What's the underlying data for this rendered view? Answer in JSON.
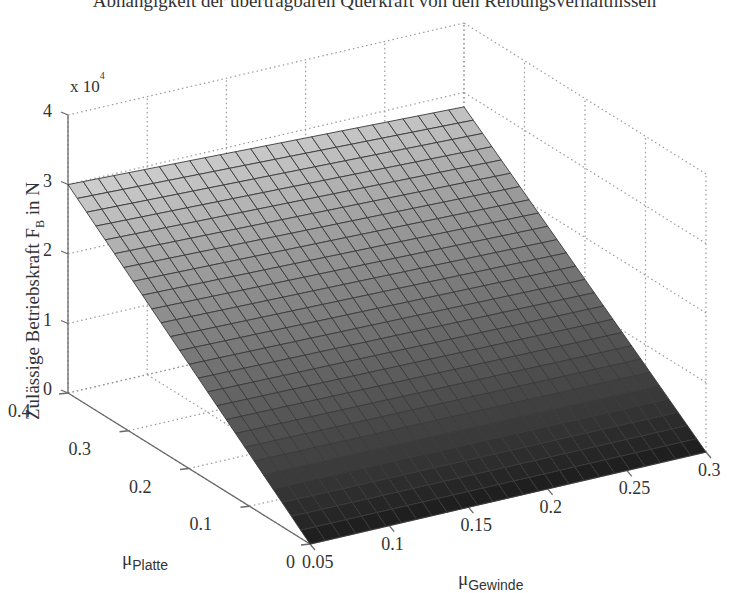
{
  "chart_data": {
    "type": "surface",
    "title": "Abhängigkeit der übertragbaren Querkraft von den Reibungsverhältnissen",
    "xlabel": "μ_Gewinde",
    "xlabel_main": "μ",
    "xlabel_sub": "Gewinde",
    "ylabel": "μ_Platte",
    "ylabel_main": "μ",
    "ylabel_sub": "Platte",
    "zlabel": "Zulässige Betriebskraft F_B in N",
    "zlabel_main": "Zulässige Betriebskraft F",
    "zlabel_sub": "B",
    "zlabel_unit": " in N",
    "z_multiplier": "x 10",
    "z_multiplier_exp": "4",
    "xlim": [
      0.05,
      0.3
    ],
    "ylim": [
      0,
      0.4
    ],
    "zlim": [
      0,
      40000
    ],
    "x_ticks": [
      "0.05",
      "0.1",
      "0.15",
      "0.2",
      "0.25",
      "0.3"
    ],
    "y_ticks": [
      "0",
      "0.1",
      "0.2",
      "0.3",
      "0.4"
    ],
    "z_ticks": [
      "0",
      "1",
      "2",
      "3",
      "4"
    ],
    "grid": true,
    "mesh": {
      "x_count": 26,
      "y_count": 26
    },
    "colormap": "gray",
    "surface_corners": [
      {
        "mu_gewinde": 0.05,
        "mu_platte": 0.4,
        "F_B": 29500
      },
      {
        "mu_gewinde": 0.3,
        "mu_platte": 0.4,
        "F_B": 29000
      },
      {
        "mu_gewinde": 0.05,
        "mu_platte": 0.0,
        "F_B": 0
      },
      {
        "mu_gewinde": 0.3,
        "mu_platte": 0.0,
        "F_B": 0
      }
    ],
    "model": "F_B ≈ 73500 · μ_Platte (nahezu unabhängig von μ_Gewinde)"
  }
}
